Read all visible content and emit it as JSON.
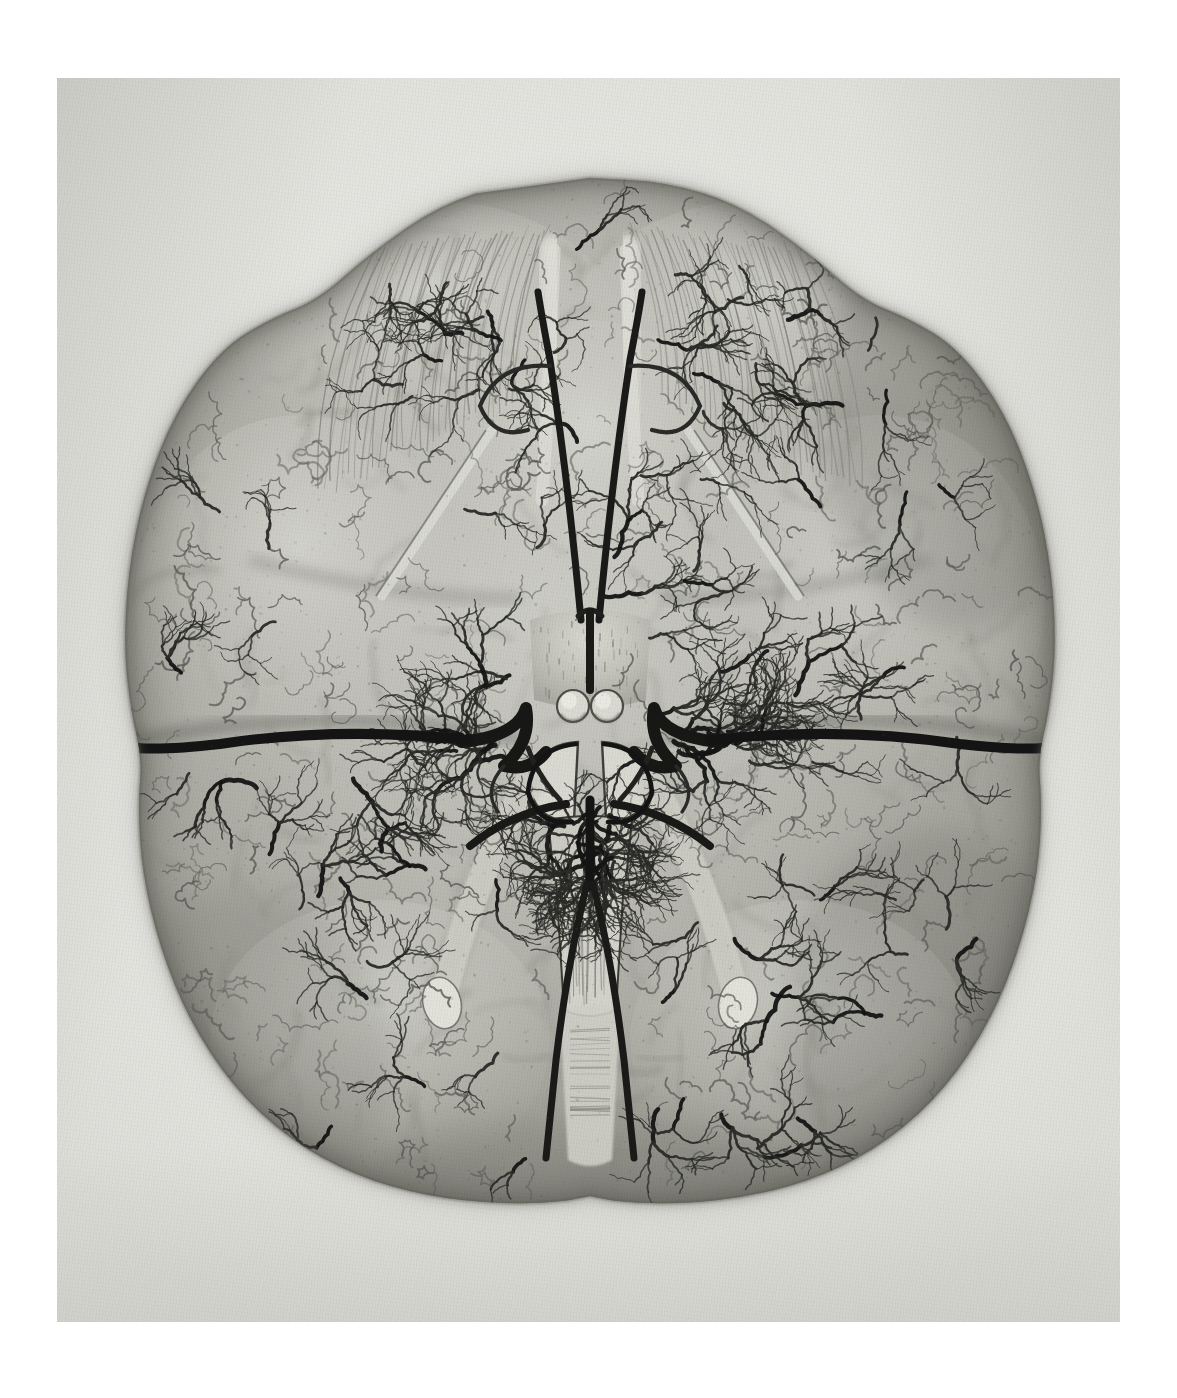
{
  "document": {
    "kind": "antique-anatomical-engraving",
    "plate_title": "Inferior (basal) surface of the human brain with its arteries",
    "medium": "stipple and line engraving, hand-toned",
    "orientation": "frontal lobes at top, cerebellum and occipital lobes at bottom",
    "has_caption_text": false,
    "has_plate_number": false,
    "margin_note": "no lettering, numbering or key is printed anywhere on the sheet"
  },
  "canvas": {
    "width": 1177,
    "height": 1398,
    "background": "#ffffff"
  },
  "plate": {
    "x": 57,
    "y": 78,
    "width": 1063,
    "height": 1244,
    "paper_light": "#eeeeec",
    "paper_mid": "#e6e6e2",
    "paper_dark": "#d8d8d3",
    "paper_edge_shadow": "#bdbdb6"
  },
  "palette": {
    "vessel_black": "#141414",
    "vessel_dark": "#2a2a28",
    "vessel_mid": "#4a4a46",
    "vessel_fine": "#5d5d58",
    "cortex_light": "#cdcdc7",
    "cortex_mid": "#b0b0a9",
    "cortex_dark": "#8e8e86",
    "cortex_shadow": "#6d6d66",
    "sulcus_shadow": "#7a7a72",
    "pale_highlight": "#e4e4dd",
    "brainstem_tone": "#bfbfb7",
    "outline_halo": "#9a9a92"
  },
  "subject": {
    "name": "human brain, inferior view",
    "bounding_box": {
      "x": 115,
      "y": 175,
      "width": 940,
      "height": 1035
    },
    "midline_x": 590
  },
  "regions": [
    {
      "id": "frontal-lobe-left",
      "label": "Left frontal lobe",
      "side": "left",
      "center": [
        430,
        330
      ],
      "tone": "#c6c6c0"
    },
    {
      "id": "frontal-lobe-right",
      "label": "Right frontal lobe",
      "side": "right",
      "center": [
        760,
        330
      ],
      "tone": "#c4c4be"
    },
    {
      "id": "olfactory-tract-left",
      "label": "Left olfactory tract",
      "side": "left",
      "center": [
        556,
        350
      ],
      "tone": "#d9d9d2"
    },
    {
      "id": "olfactory-tract-right",
      "label": "Right olfactory tract",
      "side": "right",
      "center": [
        625,
        350
      ],
      "tone": "#d9d9d2"
    },
    {
      "id": "temporal-lobe-left",
      "label": "Left temporal lobe",
      "side": "left",
      "center": [
        300,
        620
      ],
      "tone": "#b2b2ab"
    },
    {
      "id": "temporal-lobe-right",
      "label": "Right temporal lobe",
      "side": "right",
      "center": [
        880,
        620
      ],
      "tone": "#aeaea7"
    },
    {
      "id": "optic-chiasm",
      "label": "Optic chiasm",
      "side": "midline",
      "center": [
        590,
        640
      ],
      "tone": "#c8c8c1"
    },
    {
      "id": "mammillary-bodies",
      "label": "Mammillary bodies",
      "side": "midline",
      "center": [
        590,
        705
      ],
      "tone": "#dcdcd5"
    },
    {
      "id": "circle-of-willis",
      "label": "Circle of Willis",
      "side": "midline",
      "center": [
        590,
        745
      ],
      "tone": "#1b1b1b"
    },
    {
      "id": "pons",
      "label": "Pons / brainstem",
      "side": "midline",
      "center": [
        590,
        800
      ],
      "tone": "#c2c2ba"
    },
    {
      "id": "medulla",
      "label": "Medulla oblongata",
      "side": "midline",
      "center": [
        590,
        930
      ],
      "tone": "#cdcdc6"
    },
    {
      "id": "flocculus-left",
      "label": "Left flocculus / tonsil",
      "side": "left",
      "center": [
        455,
        905
      ],
      "tone": "#dcdcd5"
    },
    {
      "id": "flocculus-right",
      "label": "Right flocculus / tonsil",
      "side": "right",
      "center": [
        725,
        905
      ],
      "tone": "#dcdcd5"
    },
    {
      "id": "cerebellum-left",
      "label": "Left cerebellar hemisphere",
      "side": "left",
      "center": [
        380,
        1060
      ],
      "tone": "#a6a69e"
    },
    {
      "id": "cerebellum-right",
      "label": "Right cerebellar hemisphere",
      "side": "right",
      "center": [
        800,
        1060
      ],
      "tone": "#a2a29a"
    },
    {
      "id": "occipital-left",
      "label": "Left occipital pole",
      "side": "left",
      "center": [
        430,
        1170
      ],
      "tone": "#9b9b93"
    },
    {
      "id": "occipital-right",
      "label": "Right occipital pole",
      "side": "right",
      "center": [
        750,
        1170
      ],
      "tone": "#97978f"
    }
  ],
  "arteries": [
    {
      "id": "anterior-cerebral-left",
      "label": "Left anterior cerebral artery",
      "weight": 7,
      "color": "#1a1a18"
    },
    {
      "id": "anterior-cerebral-right",
      "label": "Right anterior cerebral artery",
      "weight": 7,
      "color": "#1a1a18"
    },
    {
      "id": "anterior-communicating",
      "label": "Anterior communicating artery",
      "weight": 5,
      "color": "#1f1f1d"
    },
    {
      "id": "internal-carotid-left",
      "label": "Left internal carotid artery",
      "weight": 12,
      "color": "#171716"
    },
    {
      "id": "internal-carotid-right",
      "label": "Right internal carotid artery",
      "weight": 12,
      "color": "#171716"
    },
    {
      "id": "middle-cerebral-left",
      "label": "Left middle cerebral artery",
      "weight": 10,
      "color": "#141414"
    },
    {
      "id": "middle-cerebral-right",
      "label": "Right middle cerebral artery",
      "weight": 10,
      "color": "#141414"
    },
    {
      "id": "posterior-communicating-left",
      "label": "Left posterior communicating artery",
      "weight": 5,
      "color": "#22221f"
    },
    {
      "id": "posterior-communicating-right",
      "label": "Right posterior communicating artery",
      "weight": 5,
      "color": "#22221f"
    },
    {
      "id": "posterior-cerebral-left",
      "label": "Left posterior cerebral artery",
      "weight": 8,
      "color": "#191917"
    },
    {
      "id": "posterior-cerebral-right",
      "label": "Right posterior cerebral artery",
      "weight": 8,
      "color": "#191917"
    },
    {
      "id": "basilar",
      "label": "Basilar artery",
      "weight": 9,
      "color": "#141414"
    },
    {
      "id": "vertebral-left",
      "label": "Left vertebral artery",
      "weight": 7,
      "color": "#1a1a18"
    },
    {
      "id": "vertebral-right",
      "label": "Right vertebral artery",
      "weight": 7,
      "color": "#1a1a18"
    }
  ],
  "render_params": {
    "cortex_branch_seeds": 88,
    "fine_capillary_seeds": 430,
    "sulcus_strokes": 150,
    "stipple_dots": 1500,
    "random_seed": 20250614
  }
}
